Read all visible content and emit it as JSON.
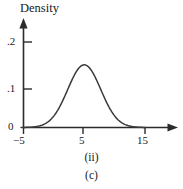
{
  "figure": {
    "axis_title": "Density",
    "caption_panel": "(ii)",
    "caption_group": "(c)",
    "line_color": "#3a3a3a",
    "axis_color": "#2b2b2b"
  },
  "chart_data": {
    "type": "line",
    "title": "",
    "ylabel": "Density",
    "xlabel": "",
    "xlim": [
      -7,
      18
    ],
    "ylim": [
      0,
      0.235
    ],
    "grid": false,
    "legend": null,
    "x_ticks": [
      -5,
      5,
      15
    ],
    "x_tick_labels": [
      "−5",
      "5",
      "15"
    ],
    "y_ticks": [
      0,
      0.1,
      0.2
    ],
    "y_tick_labels": [
      "0",
      ".1",
      ".2"
    ],
    "annotations": [
      "(ii)",
      "(c)"
    ],
    "distribution": {
      "kind": "normal",
      "mean": 5,
      "sd": 2.72,
      "peak_x": 5,
      "peak_y": 0.1466
    },
    "series": [
      {
        "name": "density",
        "x": [
          -5,
          -4,
          -3,
          -2,
          -1,
          0,
          1,
          2,
          3,
          4,
          5,
          6,
          7,
          8,
          9,
          10,
          11,
          12,
          13,
          14,
          15
        ],
        "values": [
          0.0004,
          0.0011,
          0.0029,
          0.0066,
          0.0136,
          0.0252,
          0.0424,
          0.0648,
          0.0899,
          0.1133,
          0.1466,
          0.1133,
          0.0899,
          0.0648,
          0.0424,
          0.0252,
          0.0136,
          0.0066,
          0.0029,
          0.0011,
          0.0004
        ]
      }
    ]
  }
}
